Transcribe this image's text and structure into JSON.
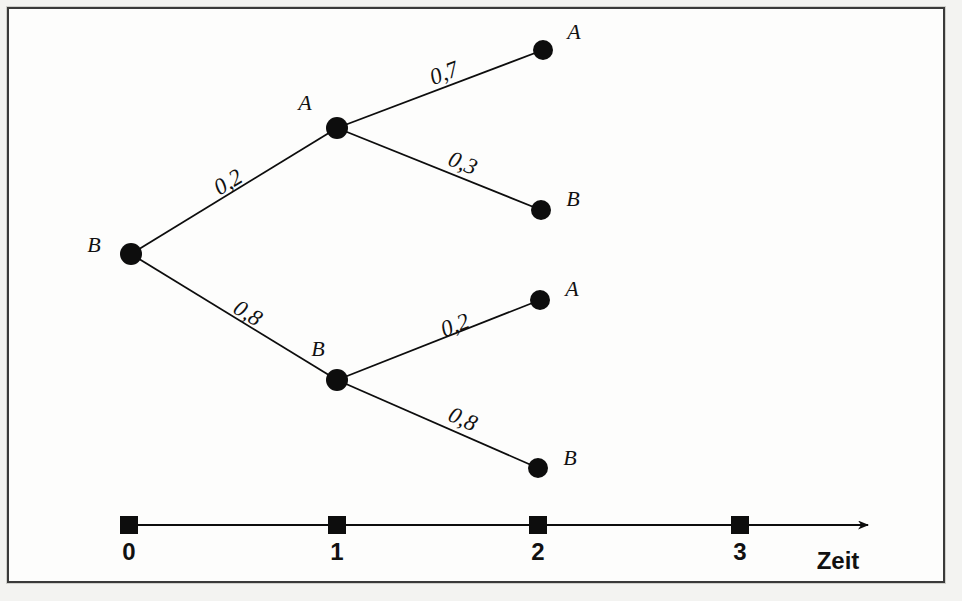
{
  "figure": {
    "kind": "probability-tree-diagram",
    "background_color": "#fdfdfc",
    "ink_color": "#0d0d0d",
    "frame": {
      "x": 7,
      "y": 7,
      "width": 938,
      "height": 576,
      "border_color": "#3a3a3a"
    }
  },
  "chart_data": {
    "type": "diagram",
    "title": "",
    "xlabel": "Zeit",
    "ylabel": "",
    "grid": false,
    "legend": "none",
    "axis": {
      "label": "Zeit",
      "label_x": 838,
      "label_y": 549,
      "y": 525,
      "x_start": 129,
      "x_end": 868,
      "tick_size": 18,
      "arrow": true,
      "ticks": [
        {
          "label": "0",
          "x": 129,
          "value": 0
        },
        {
          "label": "1",
          "x": 337,
          "value": 1
        },
        {
          "label": "2",
          "x": 538,
          "value": 2
        },
        {
          "label": "3",
          "x": 740,
          "value": 3
        }
      ],
      "tick_label_y": 540
    },
    "nodes": [
      {
        "id": "n0",
        "label": "B",
        "time": 0,
        "x": 131,
        "y": 254,
        "r": 11,
        "label_x": 94,
        "label_y": 245
      },
      {
        "id": "n1A",
        "label": "A",
        "time": 1,
        "x": 337,
        "y": 128,
        "r": 11,
        "label_x": 305,
        "label_y": 103
      },
      {
        "id": "n1B",
        "label": "B",
        "time": 1,
        "x": 337,
        "y": 380,
        "r": 11,
        "label_x": 318,
        "label_y": 349
      },
      {
        "id": "n2AA",
        "label": "A",
        "time": 2,
        "x": 543,
        "y": 50,
        "r": 10,
        "label_x": 574,
        "label_y": 32
      },
      {
        "id": "n2AB",
        "label": "B",
        "time": 2,
        "x": 541,
        "y": 210,
        "r": 10,
        "label_x": 573,
        "label_y": 199
      },
      {
        "id": "n2BA",
        "label": "A",
        "time": 2,
        "x": 540,
        "y": 300,
        "r": 10,
        "label_x": 572,
        "label_y": 289
      },
      {
        "id": "n2BB",
        "label": "B",
        "time": 2,
        "x": 538,
        "y": 468,
        "r": 10,
        "label_x": 570,
        "label_y": 458
      }
    ],
    "edges": [
      {
        "from": "n0",
        "to": "n1A",
        "label": "0,2",
        "value": 0.2,
        "label_x": 228,
        "label_y": 182,
        "label_angle": -31
      },
      {
        "from": "n0",
        "to": "n1B",
        "label": "0,8",
        "value": 0.8,
        "label_x": 248,
        "label_y": 313,
        "label_angle": 31
      },
      {
        "from": "n1A",
        "to": "n2AA",
        "label": "0,7",
        "value": 0.7,
        "label_x": 444,
        "label_y": 73,
        "label_angle": -21
      },
      {
        "from": "n1A",
        "to": "n2AB",
        "label": "0,3",
        "value": 0.3,
        "label_x": 463,
        "label_y": 163,
        "label_angle": 22
      },
      {
        "from": "n1B",
        "to": "n2BA",
        "label": "0,2",
        "value": 0.2,
        "label_x": 455,
        "label_y": 325,
        "label_angle": -21
      },
      {
        "from": "n1B",
        "to": "n2BB",
        "label": "0,8",
        "value": 0.8,
        "label_x": 463,
        "label_y": 419,
        "label_angle": 24
      }
    ]
  }
}
